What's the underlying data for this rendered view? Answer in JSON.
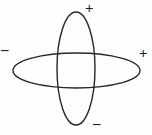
{
  "figure": {
    "name": "orbital-lobe-sign-diagram",
    "background_color": "#fefefe",
    "stroke_color": "#262626",
    "stroke_width": 1.4,
    "canvas": {
      "width": 152,
      "height": 135
    },
    "shapes": [
      {
        "id": "vertical-ellipse",
        "type": "ellipse",
        "cx": 76,
        "cy": 68.5,
        "rx": 19,
        "ry": 56.5
      },
      {
        "id": "horizontal-ellipse",
        "type": "ellipse",
        "cx": 76.5,
        "cy": 70.5,
        "rx": 63.5,
        "ry": 17.5
      }
    ],
    "labels": [
      {
        "id": "top-sign",
        "text": "+",
        "x": 85,
        "y": 1,
        "position": "top"
      },
      {
        "id": "right-sign",
        "text": "+",
        "x": 139,
        "y": 46,
        "position": "right"
      },
      {
        "id": "left-sign",
        "text": "–",
        "x": 1,
        "y": 42,
        "position": "left"
      },
      {
        "id": "bottom-sign",
        "text": "–",
        "x": 93,
        "y": 116,
        "position": "bottom"
      }
    ]
  }
}
